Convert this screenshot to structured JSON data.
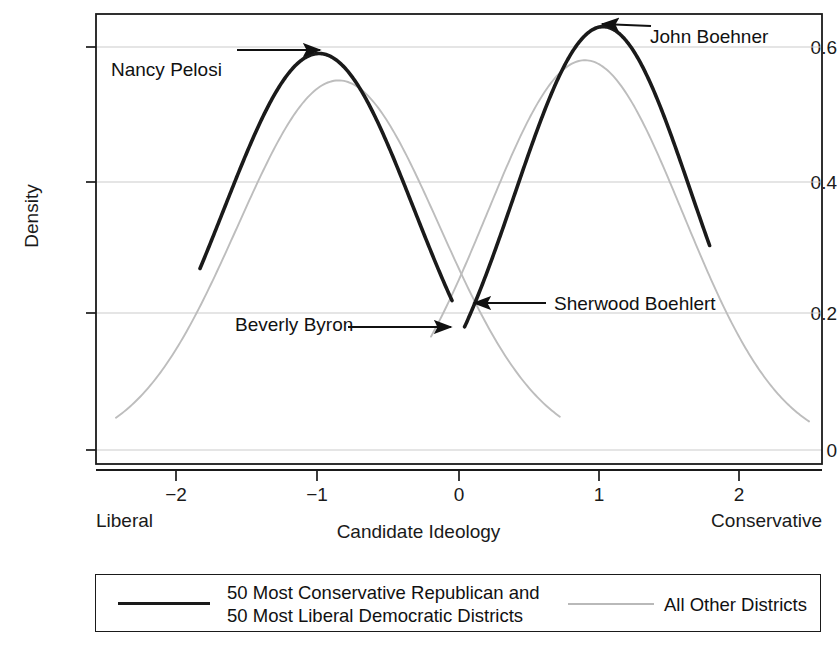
{
  "chart_data": {
    "type": "line",
    "title": "",
    "xlabel": "Candidate Ideology",
    "ylabel": "Density",
    "xlim": [
      -2.58,
      2.6
    ],
    "ylim": [
      -0.02,
      0.672
    ],
    "grid": true,
    "grid_orientation": "horizontal",
    "x_ticks": [
      -2,
      -1,
      0,
      1,
      2
    ],
    "x_tick_labels": [
      "−2",
      "−1",
      "0",
      "1",
      "2"
    ],
    "y_ticks": [
      0,
      0.2,
      0.4,
      0.6
    ],
    "y_tick_labels": [
      "0",
      "0.2",
      "0.4",
      "0.6"
    ],
    "x_axis_low_end_label": "Liberal",
    "x_axis_high_end_label": "Conservative",
    "legend_position": "below-plot",
    "series": [
      {
        "name": "50 Most Conservative Republican and 50 Most Liberal Democratic Districts",
        "color": "#1a1a1a",
        "width": 3.6,
        "components": [
          {
            "component_name": "extreme-democratic-districts-curve",
            "shape": "normal",
            "mean": -1.0,
            "sd": 0.68,
            "peak_value": 0.59,
            "x_start": -1.85,
            "x_end": -0.05,
            "y_at_x_start": 0.305,
            "y_at_x_end": 0.215
          },
          {
            "component_name": "extreme-republican-districts-curve",
            "shape": "normal",
            "mean": 1.03,
            "sd": 0.63,
            "peak_value": 0.63,
            "x_start": 0.04,
            "x_end": 1.79,
            "y_at_x_start": 0.166,
            "y_at_x_end": 0.335
          }
        ]
      },
      {
        "name": "All Other Districts",
        "color": "#bdbdbd",
        "width": 1.8,
        "components": [
          {
            "component_name": "other-democratic-districts-curve",
            "shape": "normal",
            "mean": -0.86,
            "sd": 0.72,
            "peak_value": 0.55,
            "x_start": -2.45,
            "x_end": 0.72,
            "y_at_x_start": 0.02,
            "y_at_x_end": 0.03
          },
          {
            "component_name": "other-republican-districts-curve",
            "shape": "normal",
            "mean": 0.9,
            "sd": 0.7,
            "peak_value": 0.58,
            "x_start": -0.2,
            "x_end": 2.5,
            "y_at_x_start": 0.015,
            "y_at_x_end": 0.012
          }
        ]
      }
    ],
    "annotations": [
      {
        "id": "nancy-pelosi",
        "label": "Nancy Pelosi",
        "text_x": -2.48,
        "text_y": 0.565,
        "arrow_from_x": -1.59,
        "arrow_to_x": -1.01,
        "arrow_y": 0.595,
        "arrow_direction": "right"
      },
      {
        "id": "john-boehner",
        "label": "John Boehner",
        "text_x": 1.36,
        "text_y": 0.6,
        "arrow_from_x": 1.37,
        "arrow_to_x": 1.03,
        "arrow_y": 0.632,
        "arrow_direction": "left"
      },
      {
        "id": "beverly-byron",
        "label": "Beverly Byron",
        "text_x": -1.6,
        "text_y": 0.185,
        "arrow_from_x": -0.8,
        "arrow_to_x": -0.08,
        "arrow_y": 0.182,
        "arrow_direction": "right"
      },
      {
        "id": "sherwood-boehlert",
        "label": "Sherwood Boehlert",
        "text_x": 0.49,
        "text_y": 0.215,
        "arrow_from_x": 0.47,
        "arrow_to_x": 0.09,
        "arrow_y": 0.208,
        "arrow_direction": "left"
      }
    ],
    "legend": [
      {
        "id": "legend-entry-extreme-districts",
        "swatch": "black-solid-thick",
        "line1": "50 Most Conservative Republican and",
        "line2": "50 Most Liberal Democratic Districts"
      },
      {
        "id": "legend-entry-other-districts",
        "swatch": "gray-solid-thin",
        "line1": "All Other Districts",
        "line2": ""
      }
    ]
  },
  "colors": {
    "series_black": "#1a1a1a",
    "series_gray": "#bdbdbd",
    "gridline": "#cccccc",
    "frame": "#1a1a1a",
    "text": "#111111",
    "background": "#ffffff"
  }
}
